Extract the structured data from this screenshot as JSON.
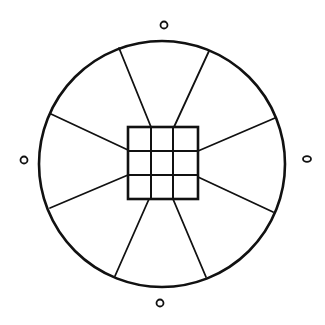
{
  "diagram": {
    "width": 325,
    "height": 325,
    "background": "#ffffff",
    "stroke": "#111111",
    "outer_circle": {
      "cx": 162,
      "cy": 164,
      "r": 123,
      "stroke_width": 2.6
    },
    "center_grid": {
      "x": 128,
      "y": 127,
      "w": 70,
      "h": 72,
      "rows": 3,
      "cols": 3,
      "v_lines": [
        151,
        173
      ],
      "h_lines": [
        151,
        175
      ],
      "stroke_width": 2.6
    },
    "radial_lines": [
      {
        "name": "top-left",
        "x1": 151,
        "y1": 127,
        "x2": 119,
        "y2": 48
      },
      {
        "name": "top-right",
        "x1": 174,
        "y1": 127,
        "x2": 209,
        "y2": 51
      },
      {
        "name": "right-upper",
        "x1": 198,
        "y1": 151,
        "x2": 275,
        "y2": 118
      },
      {
        "name": "right-lower",
        "x1": 198,
        "y1": 177,
        "x2": 273,
        "y2": 212
      },
      {
        "name": "bottom-right",
        "x1": 173,
        "y1": 199,
        "x2": 206,
        "y2": 277
      },
      {
        "name": "bottom-left",
        "x1": 149,
        "y1": 199,
        "x2": 115,
        "y2": 276
      },
      {
        "name": "left-lower",
        "x1": 128,
        "y1": 175,
        "x2": 50,
        "y2": 208
      },
      {
        "name": "left-upper",
        "x1": 128,
        "y1": 150,
        "x2": 51,
        "y2": 114
      }
    ],
    "markers": [
      {
        "name": "top",
        "cx": 164,
        "cy": 25,
        "rx": 3.5,
        "ry": 3.5
      },
      {
        "name": "left",
        "cx": 24,
        "cy": 160,
        "rx": 3.5,
        "ry": 3.5
      },
      {
        "name": "right",
        "cx": 307,
        "cy": 159,
        "rx": 4,
        "ry": 2.8
      },
      {
        "name": "bottom",
        "cx": 160,
        "cy": 303,
        "rx": 3.5,
        "ry": 3.5
      }
    ]
  }
}
